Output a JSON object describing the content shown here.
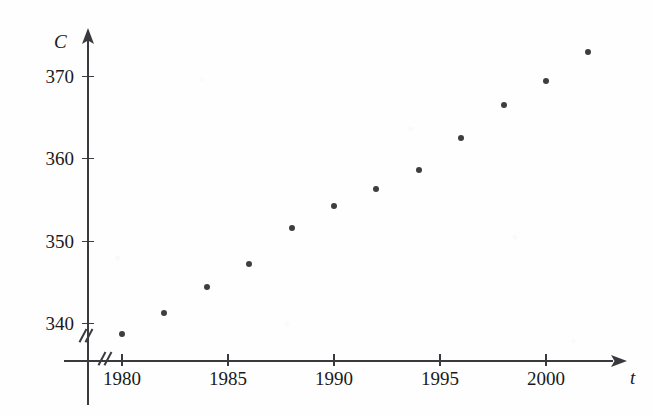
{
  "chart_data": {
    "type": "scatter",
    "title": "",
    "xlabel": "t",
    "ylabel": "C",
    "xlim": [
      1978.8,
      2003.5
    ],
    "ylim": [
      336.5,
      375.5
    ],
    "grid": false,
    "legend": "none",
    "axis_break_x": true,
    "axis_break_y": true,
    "x_ticks": [
      1980,
      1985,
      1990,
      1995,
      2000
    ],
    "y_ticks": [
      340,
      350,
      360,
      370
    ],
    "x_tick_labels": [
      "1980",
      "1985",
      "1990",
      "1995",
      "2000"
    ],
    "y_tick_labels": [
      "340",
      "350",
      "360",
      "370"
    ],
    "x": [
      1980,
      1982,
      1984,
      1986,
      1988,
      1990,
      1992,
      1994,
      1996,
      1998,
      2000,
      2002
    ],
    "y": [
      338.7,
      341.2,
      344.4,
      347.2,
      351.5,
      354.2,
      356.3,
      358.6,
      362.4,
      366.5,
      369.4,
      372.9
    ],
    "points": [
      {
        "label": "1980",
        "x": 1980,
        "y": 338.7
      },
      {
        "label": "1982",
        "x": 1982,
        "y": 341.2
      },
      {
        "label": "1984",
        "x": 1984,
        "y": 344.4
      },
      {
        "label": "1986",
        "x": 1986,
        "y": 347.2
      },
      {
        "label": "1988",
        "x": 1988,
        "y": 351.5
      },
      {
        "label": "1990",
        "x": 1990,
        "y": 354.2
      },
      {
        "label": "1992",
        "x": 1992,
        "y": 356.3
      },
      {
        "label": "1994",
        "x": 1994,
        "y": 358.6
      },
      {
        "label": "1996",
        "x": 1996,
        "y": 362.4
      },
      {
        "label": "1998",
        "x": 1998,
        "y": 366.5
      },
      {
        "label": "2000",
        "x": 2000,
        "y": 369.4
      },
      {
        "label": "2002",
        "x": 2002,
        "y": 372.9
      }
    ],
    "marker": {
      "shape": "circle",
      "color": "#3d3d42",
      "size": 6
    },
    "axis_color": "#3a3a3e",
    "background_color": "#fefefe"
  },
  "axes": {
    "y_axis_name": "C",
    "x_axis_name": "t"
  }
}
